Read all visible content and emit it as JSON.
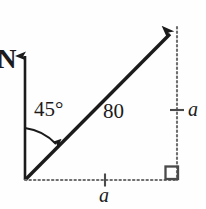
{
  "figure": {
    "type": "vector-diagram",
    "background_color": "#fefefe",
    "stroke_color": "#1b1b1b",
    "dotted_color": "#6e6e6e",
    "width": 206,
    "height": 209,
    "labels": {
      "north": "N",
      "angle": "45°",
      "magnitude": "80",
      "side_vertical": "a",
      "side_horizontal": "a"
    },
    "geometry": {
      "origin": [
        24,
        180
      ],
      "north_axis_tip": [
        25,
        48
      ],
      "vector_tip": [
        177,
        27
      ],
      "vector_angle_from_north_deg": 45,
      "vector_magnitude": 80,
      "component_vertical_label": "a",
      "component_horizontal_label": "a",
      "right_angle_corner": [
        176,
        180
      ],
      "vertical_dotted_line": [
        177,
        27,
        177,
        180
      ],
      "horizontal_dotted_line": [
        25,
        180,
        177,
        180
      ],
      "vertical_tick_at": [
        177,
        110
      ],
      "horizontal_tick_at": [
        105,
        180
      ]
    }
  }
}
